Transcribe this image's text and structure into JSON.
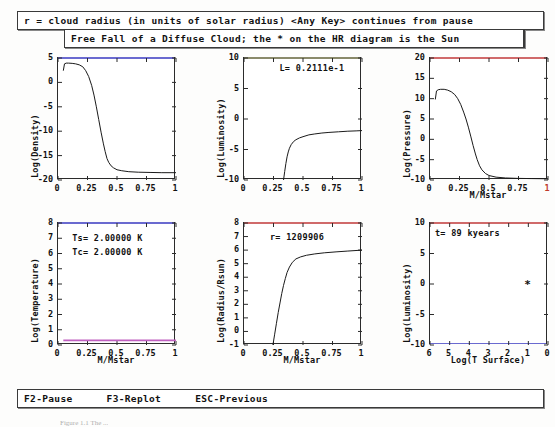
{
  "window": {
    "banner_top": "r = cloud radius (in units of solar radius) <Any Key> continues from pause",
    "banner_sub": "Free Fall of a Diffuse Cloud; the * on the HR diagram is the Sun",
    "footer": {
      "pause": "F2-Pause",
      "replot": "F3-Replot",
      "previous": "ESC-Previous"
    },
    "caption": "Figure 1.1  The ..."
  },
  "colors": {
    "axis": "#2b2b2b",
    "curve": "#1a1a1a",
    "blue_axis": "#6a6ad0",
    "red_axis": "#d06a6a",
    "magenta_line": "#c060c0",
    "green_axis": "#6aa06a",
    "text": "#111111"
  },
  "chart_data": [
    {
      "id": "density",
      "type": "line",
      "title": "",
      "xlabel": "",
      "ylabel": "Log(Density)",
      "xlim": [
        0,
        1
      ],
      "ylim": [
        -20,
        5
      ],
      "xticks": [
        0,
        0.25,
        0.5,
        0.75,
        1
      ],
      "xticklabels": [
        "0",
        "0.25",
        "0.5",
        "0.75",
        "1"
      ],
      "yticks": [
        5,
        0,
        -5,
        -10,
        -15,
        -20
      ],
      "yticklabels": [
        "5",
        "0",
        "-5",
        "-10",
        "-15",
        "-20"
      ],
      "grid": false,
      "annotations": [],
      "top_axis_color": "#6a6ad0",
      "x": [
        0.045,
        0.055,
        0.07,
        0.09,
        0.12,
        0.15,
        0.18,
        0.21,
        0.235,
        0.26,
        0.285,
        0.305,
        0.325,
        0.345,
        0.365,
        0.385,
        0.4,
        0.415,
        0.43,
        0.45,
        0.47,
        0.5,
        0.54,
        0.6,
        0.68,
        0.78,
        0.88,
        1.0
      ],
      "y": [
        2.4,
        3.8,
        3.95,
        3.95,
        3.9,
        3.8,
        3.6,
        3.2,
        2.4,
        1.2,
        -0.6,
        -2.6,
        -5.0,
        -7.6,
        -10.2,
        -12.6,
        -14.2,
        -15.6,
        -16.4,
        -17.1,
        -17.5,
        -17.9,
        -18.1,
        -18.3,
        -18.4,
        -18.45,
        -18.5,
        -18.5
      ]
    },
    {
      "id": "luminosity-mass",
      "type": "line",
      "title": "",
      "xlabel": "",
      "ylabel": "Log(Luminosity)",
      "xlim": [
        0,
        1
      ],
      "ylim": [
        -10,
        10
      ],
      "xticks": [
        0,
        0.25,
        0.5,
        0.75,
        1
      ],
      "xticklabels": [
        "0",
        "0.25",
        "0.5",
        "0.75",
        "1"
      ],
      "yticks": [
        10,
        5,
        0,
        -5,
        -10
      ],
      "yticklabels": [
        "10",
        "5",
        "0",
        "-5",
        "-10"
      ],
      "grid": false,
      "annotations": [
        {
          "text": "L= 0.2111e-1",
          "x": 0.3,
          "y": 8.3
        }
      ],
      "top_axis_color": "#8a8a6a",
      "x": [
        0.335,
        0.345,
        0.355,
        0.365,
        0.375,
        0.385,
        0.4,
        0.42,
        0.44,
        0.47,
        0.5,
        0.55,
        0.6,
        0.66,
        0.72,
        0.8,
        0.88,
        0.95,
        1.0
      ],
      "y": [
        -10.0,
        -8.6,
        -7.3,
        -6.2,
        -5.4,
        -4.8,
        -4.2,
        -3.7,
        -3.4,
        -3.1,
        -2.9,
        -2.6,
        -2.45,
        -2.3,
        -2.2,
        -2.1,
        -2.0,
        -1.95,
        -1.9
      ]
    },
    {
      "id": "pressure",
      "type": "line",
      "title": "",
      "xlabel": "M/Mstar",
      "ylabel": "Log(Pressure)",
      "xlim": [
        0,
        1
      ],
      "ylim": [
        -10,
        20
      ],
      "xticks": [
        0,
        0.25,
        0.5,
        0.75,
        1
      ],
      "xticklabels": [
        "0",
        "0.25",
        "0.5",
        "0.75",
        "1"
      ],
      "yticks": [
        20,
        15,
        10,
        5,
        0,
        -5,
        -10
      ],
      "yticklabels": [
        "20",
        "15",
        "10",
        "5",
        "0",
        "-5",
        "-10"
      ],
      "grid": false,
      "annotations": [],
      "top_axis_color": "#d06a6a",
      "x": [
        0.045,
        0.055,
        0.07,
        0.09,
        0.12,
        0.15,
        0.18,
        0.21,
        0.235,
        0.26,
        0.285,
        0.305,
        0.325,
        0.345,
        0.365,
        0.385,
        0.4,
        0.42,
        0.44,
        0.47,
        0.5,
        0.56,
        0.64,
        0.74,
        0.86,
        1.0
      ],
      "y": [
        9.8,
        11.9,
        12.2,
        12.3,
        12.3,
        12.1,
        11.7,
        11.0,
        10.0,
        8.6,
        6.7,
        5.0,
        3.0,
        0.8,
        -1.5,
        -3.6,
        -5.0,
        -6.5,
        -7.5,
        -8.4,
        -8.9,
        -9.3,
        -9.5,
        -9.6,
        -9.65,
        -9.7
      ]
    },
    {
      "id": "temperature",
      "type": "line",
      "title": "",
      "xlabel": "M/Mstar",
      "ylabel": "Log(Temperature)",
      "xlim": [
        0,
        1
      ],
      "ylim": [
        0,
        8
      ],
      "xticks": [
        0,
        0.25,
        0.5,
        0.75,
        1
      ],
      "xticklabels": [
        "0",
        "0.25",
        "0.5",
        "0.75",
        "1"
      ],
      "yticks": [
        8,
        7,
        6,
        5,
        4,
        3,
        2,
        1,
        0
      ],
      "yticklabels": [
        "8",
        "7",
        "6",
        "5",
        "4",
        "3",
        "2",
        "1",
        "0"
      ],
      "grid": false,
      "annotations": [
        {
          "text": "Ts= 2.00000 K",
          "x": 0.12,
          "y": 7.0
        },
        {
          "text": "Tc= 2.00000 K",
          "x": 0.12,
          "y": 6.1
        }
      ],
      "top_axis_color": "#6a6ad0",
      "line_color": "#c060c0",
      "x": [
        0.045,
        1.0
      ],
      "y": [
        0.301,
        0.301
      ]
    },
    {
      "id": "radius",
      "type": "line",
      "title": "",
      "xlabel": "M/Mstar",
      "ylabel": "Log(Radius/Rsun)",
      "xlim": [
        0,
        1
      ],
      "ylim": [
        -1,
        8
      ],
      "xticks": [
        0,
        0.25,
        0.5,
        0.75,
        1
      ],
      "xticklabels": [
        "0",
        "0.25",
        "0.5",
        "0.75",
        "1"
      ],
      "yticks": [
        8,
        7,
        6,
        5,
        4,
        3,
        2,
        1,
        0,
        -1
      ],
      "yticklabels": [
        "8",
        "7",
        "6",
        "5",
        "4",
        "3",
        "2",
        "1",
        "0",
        "-1"
      ],
      "grid": false,
      "annotations": [
        {
          "text": "r=  1209906",
          "x": 0.22,
          "y": 7.0
        }
      ],
      "top_axis_color": "#d06a6a",
      "x": [
        0.245,
        0.26,
        0.275,
        0.29,
        0.305,
        0.32,
        0.335,
        0.35,
        0.365,
        0.385,
        0.41,
        0.44,
        0.48,
        0.53,
        0.6,
        0.68,
        0.78,
        0.88,
        1.0
      ],
      "y": [
        -1.0,
        -0.2,
        0.6,
        1.4,
        2.1,
        2.8,
        3.4,
        3.9,
        4.35,
        4.75,
        5.1,
        5.35,
        5.5,
        5.62,
        5.72,
        5.8,
        5.87,
        5.93,
        6.0
      ]
    },
    {
      "id": "hr-diagram",
      "type": "scatter",
      "title": "",
      "xlabel": "Log(T Surface)",
      "ylabel": "Log(Luminosity)",
      "xlim": [
        6,
        0
      ],
      "ylim": [
        -10,
        10
      ],
      "xticks": [
        6,
        5,
        4,
        3,
        2,
        1,
        0
      ],
      "xticklabels": [
        "6",
        "5",
        "4",
        "3",
        "2",
        "1",
        "0"
      ],
      "yticks": [
        10,
        5,
        0,
        -5,
        -10
      ],
      "yticklabels": [
        "10",
        "5",
        "0",
        "-5",
        "-10"
      ],
      "grid": false,
      "annotations": [
        {
          "text": "t=      89 kyears",
          "x": 5.75,
          "y": 8.4
        }
      ],
      "top_axis_color": "#d06a6a",
      "bottom_axis_color": "#6a6ad0",
      "points": [
        {
          "x": 1.05,
          "y": 0.0,
          "marker": "*",
          "label": "Sun"
        }
      ]
    }
  ]
}
